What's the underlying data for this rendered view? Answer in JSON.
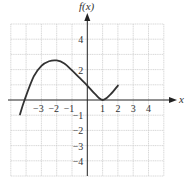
{
  "chart_data": {
    "type": "line",
    "title": "",
    "xlabel": "x",
    "ylabel": "f(x)",
    "xlim": [
      -5,
      5
    ],
    "ylim": [
      -5,
      5
    ],
    "grid": true,
    "legend": null,
    "x_ticks": [
      -3,
      -2,
      -1,
      1,
      2,
      3,
      4
    ],
    "x_tick_labels": [
      "−3",
      "−2",
      "−1",
      "1",
      "2",
      "3",
      "4"
    ],
    "y_ticks": [
      4,
      2,
      -1,
      -2,
      -3,
      -4
    ],
    "y_tick_labels": [
      "4",
      "2",
      "−1",
      "−2",
      "−3",
      "−4"
    ],
    "series": [
      {
        "name": "f(x)",
        "x": [
          -4.4,
          -4.1,
          -3.5,
          -3.0,
          -2.5,
          -2.0,
          -1.5,
          -1.0,
          -0.5,
          0.0,
          0.5,
          1.0,
          1.5,
          2.0
        ],
        "y": [
          -0.95,
          0.0,
          1.55,
          2.25,
          2.55,
          2.6,
          2.4,
          1.95,
          1.45,
          0.95,
          0.4,
          0.0,
          0.35,
          0.95
        ]
      }
    ],
    "key_points": {
      "start": [
        -4.4,
        -0.95
      ],
      "x_intercepts": [
        -4.1,
        1
      ],
      "local_max": [
        -2,
        2.6
      ],
      "y_intercept": [
        0,
        1
      ],
      "local_min": [
        1,
        0
      ],
      "end": [
        2,
        1
      ]
    }
  },
  "labels": {
    "y_axis": "f(x)",
    "x_axis": "x"
  }
}
